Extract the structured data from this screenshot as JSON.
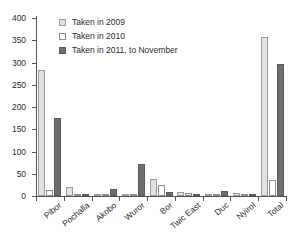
{
  "chart_data": {
    "type": "bar",
    "title": "",
    "subtitle": "",
    "xlabel": "",
    "ylabel": "",
    "ylim": [
      0,
      400
    ],
    "ytick_values": [
      0,
      50,
      100,
      150,
      200,
      250,
      300,
      350,
      400
    ],
    "ytick_labels": [
      "0",
      "50",
      "100",
      "150",
      "200",
      "250",
      "300",
      "350",
      "400"
    ],
    "grid": false,
    "legend_position": "top-center",
    "categories": [
      "Pibor",
      "Pochalla",
      "Akobo",
      "Wuror",
      "Bor",
      "Twic East",
      "Duc",
      "Nyirol",
      "Total"
    ],
    "series": [
      {
        "name": "Taken in 2009",
        "color": "#e2e2e0",
        "values": [
          283,
          20,
          2,
          1,
          38,
          10,
          4,
          7,
          358
        ]
      },
      {
        "name": "Taken in 2010",
        "color": "#ffffff",
        "values": [
          14,
          1,
          2,
          0,
          24,
          7,
          3,
          1,
          37
        ]
      },
      {
        "name": "Taken in 2011, to November",
        "color": "#6f6f6f",
        "values": [
          176,
          5,
          15,
          73,
          8,
          2,
          12,
          1,
          297
        ]
      }
    ]
  },
  "legend": {
    "items": [
      {
        "label": "Taken in 2009",
        "swatch": "legend-swatch-2009"
      },
      {
        "label": "Taken in 2010",
        "swatch": "legend-swatch-2010"
      },
      {
        "label": "Taken in 2011, to November",
        "swatch": "legend-swatch-2011"
      }
    ]
  },
  "axes": {
    "y_labels": [
      "400",
      "350",
      "300",
      "250",
      "200",
      "150",
      "100",
      "50",
      "0"
    ],
    "x_labels": [
      "Pibor",
      "Pochalla",
      "Akobo",
      "Wuror",
      "Bor",
      "Twic East",
      "Duc",
      "Nyirol",
      "Total"
    ]
  }
}
